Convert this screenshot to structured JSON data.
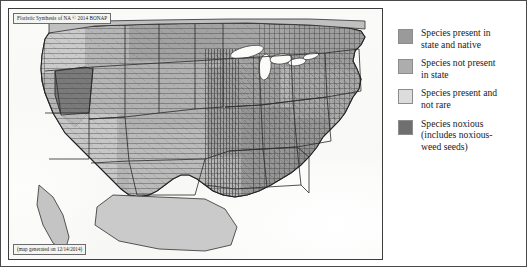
{
  "figure": {
    "kind": "choropleth-map-with-legend",
    "border_color": "#4a4a4a",
    "background_color": "#ffffff"
  },
  "map": {
    "title": "Floristic Synthesis of NA © 2014 BONAP",
    "caption": "(map generated on 12/14/2014)",
    "region": "Contiguous United States",
    "subdivision_level": "county",
    "land_color": "#b9b9b9",
    "ocean_color": "#fafaf8",
    "border_color": "#3d3d3d"
  },
  "legend": {
    "items": [
      {
        "swatch_color": "#9a9a9a",
        "label": "Species present in state and native",
        "line1": "Species present in",
        "line2": "state and native"
      },
      {
        "swatch_color": "#adadad",
        "label": "Species not present in state",
        "line1": "Species not present",
        "line2": "in state"
      },
      {
        "swatch_color": "#dcdcdc",
        "label": "Species present and not rare",
        "line1": "Species present and",
        "line2": "not rare"
      },
      {
        "swatch_color": "#6f6f6f",
        "label": "Species noxious (includes noxious-weed seeds)",
        "line1": "Species noxious",
        "line2": "(includes noxious-",
        "line3": "weed seeds)"
      }
    ]
  }
}
